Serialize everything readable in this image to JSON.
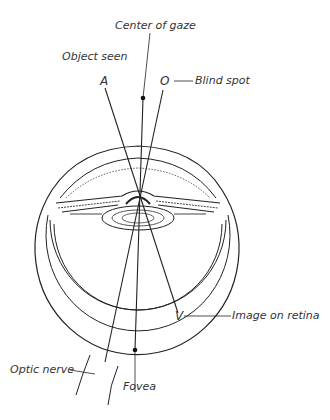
{
  "diagram": {
    "type": "eye-cross-section",
    "labels": {
      "center_of_gaze": "Center of gaze",
      "object_seen": "Object seen",
      "blind_spot": "Blind spot",
      "image_on_retina": "Image on retina",
      "optic_nerve": "Optic nerve",
      "fovea": "Fovea"
    },
    "letters": {
      "object": "A",
      "blind_spot_marker": "O",
      "image": "V"
    },
    "colors": {
      "line": "#222222",
      "text": "#333333",
      "background": "#ffffff"
    }
  }
}
